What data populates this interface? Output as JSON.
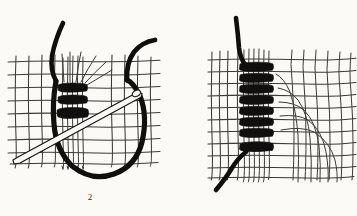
{
  "document": {
    "title": "Hemstitch / bar-wrapping needlework diagram",
    "background_color": "#fbfaf7",
    "ink_color": "#100f0d",
    "mesh_color": "#3b3a36",
    "width": 357,
    "height": 216,
    "style": "scanned black-and-white line engraving"
  },
  "figures": [
    {
      "id": "figure-2",
      "caption": "2",
      "description": "Needle drawing thread through an open-weave fabric mesh; three completed wrapping coils bind a vertical bundle of threads, with a large loop of working thread hanging below and the threaded needle passing diagonally.",
      "elements": {
        "mesh_label": "open woven ground fabric",
        "bundle_label": "gathered vertical threads",
        "coil_count": 3,
        "needle_label": "threaded needle",
        "loop_label": "working thread loop",
        "thread_tail_count": 2
      }
    },
    {
      "id": "figure-3",
      "caption": "3",
      "description": "Completed column of wrapped bars pulling the warp threads together; curved distorted threads fan out to the right and a thick working thread enters at top-left and exits at bottom-left.",
      "elements": {
        "mesh_label": "open woven ground fabric",
        "bundle_label": "gathered vertical threads",
        "coil_count": 8,
        "fan_label": "drawn-in curved threads",
        "thread_tail_count": 2
      }
    }
  ]
}
